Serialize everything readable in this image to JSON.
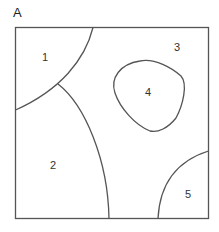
{
  "diagram": {
    "panel_label": "A",
    "regions": [
      {
        "id": "region-1",
        "label": "1"
      },
      {
        "id": "region-2",
        "label": "2"
      },
      {
        "id": "region-3",
        "label": "3"
      },
      {
        "id": "region-4",
        "label": "4"
      },
      {
        "id": "region-5",
        "label": "5"
      }
    ],
    "colors": {
      "stroke": "#555555",
      "background": "#ffffff",
      "text": "#333333"
    }
  }
}
